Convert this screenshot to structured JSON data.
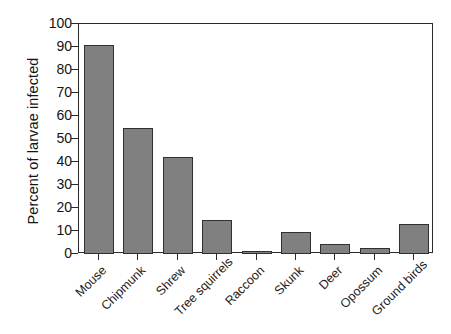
{
  "chart_data": {
    "type": "bar",
    "title": "",
    "subtitle": "",
    "xlabel": "",
    "ylabel": "Percent of larvae infected",
    "categories": [
      "Mouse",
      "Chipmunk",
      "Shrew",
      "Tree squirrels",
      "Raccoon",
      "Skunk",
      "Deer",
      "Opossum",
      "Ground birds"
    ],
    "values": [
      91,
      55,
      42,
      15,
      1.5,
      9.5,
      4.5,
      2.5,
      13
    ],
    "ylim": [
      0,
      100
    ],
    "yticks": [
      0,
      10,
      20,
      30,
      40,
      50,
      60,
      70,
      80,
      90,
      100
    ],
    "ytick_labels": [
      "0",
      "10",
      "20",
      "30",
      "40",
      "50",
      "60",
      "70",
      "80",
      "90",
      "100"
    ],
    "grid": false,
    "legend": false,
    "legend_position": "none",
    "bar_color": "#808080",
    "bar_edge_color": "#303030",
    "axis_color": "#2b2b2b",
    "background_color": "#ffffff",
    "xtick_label_rotation": 45
  }
}
